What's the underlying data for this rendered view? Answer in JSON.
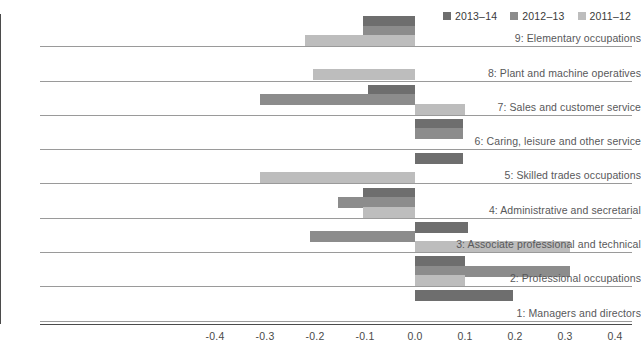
{
  "legend": {
    "position": "top-right",
    "entries": [
      {
        "label": "2013–14",
        "color": "#6e6e6e"
      },
      {
        "label": "2012–13",
        "color": "#8c8c8c"
      },
      {
        "label": "2011–12",
        "color": "#bdbdbd"
      }
    ]
  },
  "chart_data": {
    "type": "bar",
    "orientation": "horizontal",
    "title": "",
    "subtitle": "",
    "xlabel": "",
    "ylabel": "",
    "xlim": [
      -0.4,
      0.4
    ],
    "xticks": [
      "-0.4",
      "-0.3",
      "-0.2",
      "-0.1",
      "0.0",
      "0.1",
      "0.2",
      "0.3",
      "0.4"
    ],
    "xtick_values": [
      -0.4,
      -0.3,
      -0.2,
      -0.1,
      0.0,
      0.1,
      0.2,
      0.3,
      0.4
    ],
    "grid": false,
    "zero_line": true,
    "legend_position": "top-right",
    "categories": [
      "9: Elementary occupations",
      "8: Plant and machine operatives",
      "7: Sales and customer service",
      "6: Caring, leisure and other service",
      "5: Skilled trades occupations",
      "4: Administrative and secretarial",
      "3: Associate professional and technical",
      "2: Professional occupations",
      "1: Managers and directors"
    ],
    "series": [
      {
        "name": "2013–14",
        "color": "#6e6e6e",
        "values": [
          -0.105,
          0.0,
          -0.095,
          0.095,
          0.095,
          -0.105,
          0.105,
          0.1,
          0.195
        ]
      },
      {
        "name": "2012–13",
        "color": "#8c8c8c",
        "values": [
          -0.105,
          0.0,
          -0.31,
          0.095,
          0.0,
          -0.155,
          -0.21,
          0.31,
          0.0
        ]
      },
      {
        "name": "2011–12",
        "color": "#bdbdbd",
        "values": [
          -0.22,
          -0.205,
          0.1,
          0.0,
          -0.31,
          -0.105,
          0.31,
          0.1,
          0.0
        ]
      }
    ]
  }
}
